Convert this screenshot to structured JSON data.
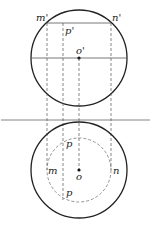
{
  "diagram": {
    "type": "orthographic-projection",
    "front_view": {
      "circle": {
        "cx": 79,
        "cy": 58,
        "r": 48
      },
      "axis_line": {
        "y": 58
      },
      "chord": {
        "y": 23
      },
      "labels": {
        "m_prime": "m'",
        "n_prime": "n'",
        "p_prime": "p'",
        "o_prime": "o'"
      }
    },
    "separator": {
      "y": 120
    },
    "top_view": {
      "outer_circle": {
        "cx": 79,
        "cy": 170,
        "r": 48
      },
      "inner_circle": {
        "cx": 79,
        "cy": 170,
        "r": 32,
        "style": "dashed"
      },
      "labels": {
        "m": "m",
        "n": "n",
        "p_upper": "p",
        "p_lower": "p",
        "o": "o"
      }
    },
    "projection_lines": [
      "m",
      "p",
      "o",
      "n"
    ],
    "colors": {
      "stroke": "#222222",
      "thin": "#555555"
    }
  }
}
